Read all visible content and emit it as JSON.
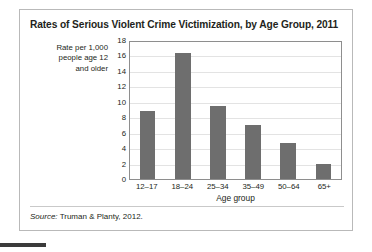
{
  "figure": {
    "title": "Rates of Serious Violent Crime Victimization, by Age Group, 2011",
    "source_label": "Source:",
    "source_text": " Truman & Planty, 2012."
  },
  "chart_data": {
    "type": "bar",
    "title": "Rates of Serious Violent Crime Victimization, by Age Group, 2011",
    "xlabel": "Age group",
    "ylabel": "Rate per 1,000 people age 12 and older",
    "ylabel_lines": [
      "Rate per 1,000",
      "people age 12",
      "and older"
    ],
    "categories": [
      "12–17",
      "18–24",
      "25–34",
      "35–49",
      "50–64",
      "65+"
    ],
    "values": [
      8.8,
      16.3,
      9.4,
      7.0,
      4.7,
      1.9
    ],
    "ylim": [
      0,
      18
    ],
    "yticks": [
      18,
      16,
      14,
      12,
      10,
      8,
      6,
      4,
      2,
      0
    ],
    "grid": true,
    "legend": "none",
    "bar_color": "#6e6e6e",
    "gridline_color": "#e3e3e3",
    "axis_color": "#8e8e8e"
  }
}
